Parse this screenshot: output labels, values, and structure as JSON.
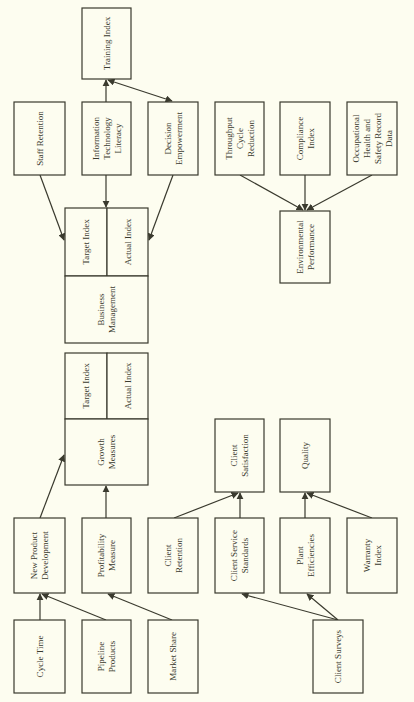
{
  "diagram": {
    "orientation": "rotated -90deg (text reads bottom-to-top)",
    "colors": {
      "background": "#fdfdf0",
      "stroke": "#3a3a2e",
      "text": "#3a3a2e"
    },
    "nodes": [
      {
        "id": "training_index",
        "lines": [
          "Training Index"
        ],
        "x": 82,
        "y": 8,
        "w": 49,
        "h": 71
      },
      {
        "id": "staff_retention",
        "lines": [
          "Staff Retention"
        ],
        "x": 14,
        "y": 102,
        "w": 51,
        "h": 73
      },
      {
        "id": "it_literacy",
        "lines": [
          "Information",
          "Technology",
          "Literacy"
        ],
        "x": 82,
        "y": 102,
        "w": 49,
        "h": 73
      },
      {
        "id": "decision_empowerment",
        "lines": [
          "Decision",
          "Empowerment"
        ],
        "x": 148,
        "y": 102,
        "w": 50,
        "h": 73
      },
      {
        "id": "throughput_cycle_reduction",
        "lines": [
          "Throughput",
          "Cycle",
          "Reduction"
        ],
        "x": 215,
        "y": 102,
        "w": 49,
        "h": 73
      },
      {
        "id": "compliance_index",
        "lines": [
          "Compliance",
          "Index"
        ],
        "x": 280,
        "y": 102,
        "w": 50,
        "h": 73
      },
      {
        "id": "ohs_record_data",
        "lines": [
          "Occupational",
          "Health and",
          "Safety Record",
          "Data"
        ],
        "x": 347,
        "y": 102,
        "w": 50,
        "h": 73
      },
      {
        "id": "environmental_performance",
        "lines": [
          "Environmental",
          "Performance"
        ],
        "x": 280,
        "y": 211,
        "w": 50,
        "h": 72
      },
      {
        "id": "bm_target_index",
        "lines": [
          "Target Index"
        ],
        "x": 65,
        "y": 208,
        "w": 42,
        "h": 68
      },
      {
        "id": "bm_actual_index",
        "lines": [
          "Actual Index"
        ],
        "x": 107,
        "y": 208,
        "w": 41,
        "h": 68
      },
      {
        "id": "business_management",
        "lines": [
          "Business",
          "Management"
        ],
        "x": 65,
        "y": 276,
        "w": 83,
        "h": 67
      },
      {
        "id": "gm_target_index",
        "lines": [
          "Target Index"
        ],
        "x": 65,
        "y": 353,
        "w": 42,
        "h": 66
      },
      {
        "id": "gm_actual_index",
        "lines": [
          "Actual Index"
        ],
        "x": 107,
        "y": 353,
        "w": 41,
        "h": 66
      },
      {
        "id": "growth_measures",
        "lines": [
          "Growth",
          "Measures"
        ],
        "x": 65,
        "y": 419,
        "w": 83,
        "h": 66
      },
      {
        "id": "client_satisfaction",
        "lines": [
          "Client",
          "Satisfaction"
        ],
        "x": 215,
        "y": 419,
        "w": 49,
        "h": 73
      },
      {
        "id": "quality",
        "lines": [
          "Quality"
        ],
        "x": 280,
        "y": 419,
        "w": 50,
        "h": 73
      },
      {
        "id": "new_product_development",
        "lines": [
          "New Product",
          "Development"
        ],
        "x": 14,
        "y": 518,
        "w": 51,
        "h": 75
      },
      {
        "id": "profitability_measure",
        "lines": [
          "Profitability",
          "Measure"
        ],
        "x": 82,
        "y": 518,
        "w": 49,
        "h": 75
      },
      {
        "id": "client_retention",
        "lines": [
          "Client",
          "Retention"
        ],
        "x": 148,
        "y": 518,
        "w": 50,
        "h": 75
      },
      {
        "id": "client_service_standards",
        "lines": [
          "Client Service",
          "Standards"
        ],
        "x": 215,
        "y": 518,
        "w": 49,
        "h": 75
      },
      {
        "id": "plant_efficiencies",
        "lines": [
          "Plant",
          "Efficiencies"
        ],
        "x": 280,
        "y": 518,
        "w": 50,
        "h": 75
      },
      {
        "id": "warranty_index",
        "lines": [
          "Warranty",
          "Index"
        ],
        "x": 347,
        "y": 518,
        "w": 50,
        "h": 75
      },
      {
        "id": "cycle_time",
        "lines": [
          "Cycle Time"
        ],
        "x": 14,
        "y": 620,
        "w": 51,
        "h": 73
      },
      {
        "id": "pipeline_products",
        "lines": [
          "Pipeline",
          "Products"
        ],
        "x": 82,
        "y": 620,
        "w": 49,
        "h": 73
      },
      {
        "id": "market_share",
        "lines": [
          "Market Share"
        ],
        "x": 148,
        "y": 620,
        "w": 50,
        "h": 73
      },
      {
        "id": "client_surveys",
        "lines": [
          "Client Surveys"
        ],
        "x": 313,
        "y": 620,
        "w": 50,
        "h": 73
      }
    ],
    "edges": [
      {
        "from": "it_literacy",
        "to": "training_index",
        "x1": 106,
        "y1": 102,
        "x2": 106,
        "y2": 80
      },
      {
        "from": "training_index",
        "to": "decision_empowerment",
        "x1": 108,
        "y1": 80,
        "x2": 172,
        "y2": 101,
        "bidirectional": true
      },
      {
        "from": "staff_retention",
        "to": "bm_target_index",
        "x1": 40,
        "y1": 175,
        "x2": 64,
        "y2": 240
      },
      {
        "from": "it_literacy",
        "to": "bm_target_index",
        "x1": 106,
        "y1": 175,
        "x2": 106,
        "y2": 207
      },
      {
        "from": "decision_empowerment",
        "to": "bm_actual_index",
        "x1": 173,
        "y1": 175,
        "x2": 149,
        "y2": 240
      },
      {
        "from": "throughput_cycle_reduction",
        "to": "environmental_performance",
        "x1": 240,
        "y1": 175,
        "x2": 303,
        "y2": 210
      },
      {
        "from": "compliance_index",
        "to": "environmental_performance",
        "x1": 305,
        "y1": 175,
        "x2": 305,
        "y2": 210
      },
      {
        "from": "ohs_record_data",
        "to": "environmental_performance",
        "x1": 372,
        "y1": 175,
        "x2": 307,
        "y2": 210
      },
      {
        "from": "new_product_development",
        "to": "growth_measures",
        "x1": 40,
        "y1": 518,
        "x2": 64,
        "y2": 455
      },
      {
        "from": "profitability_measure",
        "to": "growth_measures",
        "x1": 106,
        "y1": 518,
        "x2": 106,
        "y2": 486
      },
      {
        "from": "client_retention",
        "to": "client_satisfaction",
        "x1": 174,
        "y1": 518,
        "x2": 238,
        "y2": 493
      },
      {
        "from": "client_service_standards",
        "to": "client_satisfaction",
        "x1": 240,
        "y1": 518,
        "x2": 240,
        "y2": 493
      },
      {
        "from": "plant_efficiencies",
        "to": "quality",
        "x1": 305,
        "y1": 518,
        "x2": 305,
        "y2": 493
      },
      {
        "from": "warranty_index",
        "to": "quality",
        "x1": 372,
        "y1": 518,
        "x2": 307,
        "y2": 493
      },
      {
        "from": "cycle_time",
        "to": "new_product_development",
        "x1": 40,
        "y1": 620,
        "x2": 40,
        "y2": 594
      },
      {
        "from": "pipeline_products",
        "to": "new_product_development",
        "x1": 106,
        "y1": 620,
        "x2": 42,
        "y2": 594
      },
      {
        "from": "market_share",
        "to": "profitability_measure",
        "x1": 172,
        "y1": 620,
        "x2": 108,
        "y2": 594
      },
      {
        "from": "client_surveys",
        "to": "client_service_standards",
        "x1": 338,
        "y1": 620,
        "x2": 242,
        "y2": 594
      },
      {
        "from": "client_surveys",
        "to": "plant_efficiencies",
        "x1": 338,
        "y1": 620,
        "x2": 307,
        "y2": 594
      }
    ]
  }
}
